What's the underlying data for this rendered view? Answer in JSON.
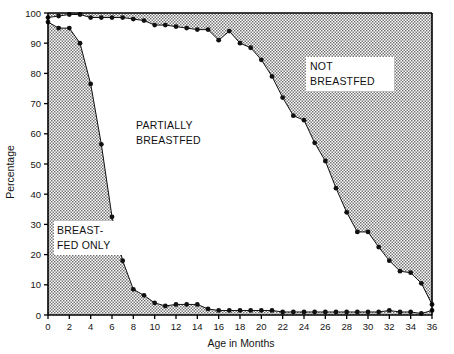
{
  "chart_data": {
    "type": "area",
    "title": "",
    "xlabel": "Age in Months",
    "ylabel": "Percentage",
    "xlim": [
      0,
      36
    ],
    "ylim": [
      0,
      100
    ],
    "xticks": [
      0,
      2,
      4,
      6,
      8,
      10,
      12,
      14,
      16,
      18,
      20,
      22,
      24,
      26,
      28,
      30,
      32,
      34,
      36
    ],
    "yticks": [
      0,
      10,
      20,
      30,
      40,
      50,
      60,
      70,
      80,
      90,
      100
    ],
    "xtick_labels": [
      "0",
      "2",
      "4",
      "6",
      "8",
      "10",
      "12",
      "14",
      "16",
      "18",
      "20",
      "22",
      "24",
      "26",
      "28",
      "30",
      "32",
      "34",
      "36"
    ],
    "ytick_labels": [
      "0",
      "10",
      "20",
      "30",
      "40",
      "50",
      "60",
      "70",
      "80",
      "90",
      "100"
    ],
    "grid": false,
    "legend_position": "in-plot-annotations",
    "x": [
      0,
      1,
      2,
      3,
      4,
      5,
      6,
      7,
      8,
      9,
      10,
      11,
      12,
      13,
      14,
      15,
      16,
      17,
      18,
      19,
      20,
      21,
      22,
      23,
      24,
      25,
      26,
      27,
      28,
      29,
      30,
      31,
      32,
      33,
      34,
      35,
      36
    ],
    "series": [
      {
        "name": "Breastfed only (upper bound of lower shaded band)",
        "values": [
          97,
          95,
          95,
          90,
          76.5,
          56.5,
          32.5,
          18,
          8.5,
          6.5,
          4,
          3,
          3.5,
          3.5,
          3.5,
          2,
          1.5,
          1.5,
          1.5,
          1.5,
          1.5,
          1.5,
          1,
          1,
          1,
          1,
          1,
          1,
          1,
          1,
          1,
          1,
          1.5,
          1,
          1,
          0.5,
          1.5
        ]
      },
      {
        "name": "Any breastfeeding (upper bound of partially breastfed region)",
        "values": [
          98.5,
          99,
          99.5,
          99.5,
          98.5,
          98.5,
          98.5,
          98.5,
          98,
          97.5,
          96,
          96,
          95.5,
          95,
          94.5,
          94.5,
          91,
          94,
          90,
          88.5,
          84.5,
          79,
          72,
          66,
          64.5,
          57,
          51,
          42,
          34,
          27.5,
          27.5,
          22.5,
          18,
          14.5,
          14,
          10.5,
          3.5
        ]
      }
    ],
    "regions": [
      {
        "id": "breastfed-only",
        "label_line1": "BREAST-",
        "label_line2": "FED ONLY",
        "fill": "dotted-gray"
      },
      {
        "id": "partially-breastfed",
        "label_line1": "PARTIALLY",
        "label_line2": "BREASTFED",
        "fill": "white"
      },
      {
        "id": "not-breastfed",
        "label_line1": "NOT",
        "label_line2": "BREASTFED",
        "fill": "dotted-gray"
      }
    ],
    "marker": "filled-circle",
    "axis_color": "#000000",
    "marker_color": "#111111",
    "shade_color": "#b4b4b4",
    "background_color": "#ffffff"
  }
}
